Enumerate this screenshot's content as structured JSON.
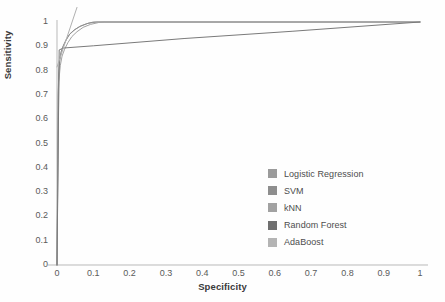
{
  "chart_data": {
    "type": "line",
    "title": "",
    "xlabel": "Specificity",
    "ylabel": "Sensitivity",
    "xlim": [
      0,
      1
    ],
    "ylim": [
      0,
      1
    ],
    "grid": false,
    "legend_position": "center-right",
    "xticks": [
      "0",
      "0.1",
      "0.2",
      "0.3",
      "0.4",
      "0.5",
      "0.6",
      "0.7",
      "0.8",
      "0.9",
      "1"
    ],
    "yticks": [
      "0",
      "0.1",
      "0.2",
      "0.3",
      "0.4",
      "0.5",
      "0.6",
      "0.7",
      "0.8",
      "0.9",
      "1"
    ],
    "series": [
      {
        "name": "Logistic Regression",
        "color": "#9b9b9b",
        "points": [
          [
            0,
            0
          ],
          [
            0.004,
            0.72
          ],
          [
            0.006,
            0.8
          ],
          [
            0.008,
            0.845
          ],
          [
            0.012,
            0.88
          ],
          [
            0.018,
            0.905
          ],
          [
            0.026,
            0.93
          ],
          [
            0.036,
            0.952
          ],
          [
            0.05,
            0.97
          ],
          [
            0.066,
            0.984
          ],
          [
            0.086,
            0.995
          ],
          [
            0.11,
            1.0
          ],
          [
            1,
            1
          ]
        ]
      },
      {
        "name": "SVM",
        "color": "#8e8e8e",
        "points": [
          [
            0,
            0
          ],
          [
            0.003,
            0.7
          ],
          [
            0.005,
            0.79
          ],
          [
            0.007,
            0.84
          ],
          [
            0.011,
            0.875
          ],
          [
            0.017,
            0.9
          ],
          [
            0.025,
            0.925
          ],
          [
            0.034,
            0.948
          ],
          [
            0.047,
            0.966
          ],
          [
            0.062,
            0.981
          ],
          [
            0.082,
            0.993
          ],
          [
            0.1,
            1.0
          ],
          [
            1,
            1
          ]
        ]
      },
      {
        "name": "kNN",
        "color": "#a2a2a2",
        "points": [
          [
            0,
            0
          ],
          [
            0.005,
            0.755
          ],
          [
            0.009,
            0.82
          ],
          [
            0.014,
            0.86
          ],
          [
            0.021,
            0.888
          ],
          [
            0.03,
            0.915
          ],
          [
            0.041,
            0.94
          ],
          [
            0.055,
            0.96
          ],
          [
            0.072,
            0.978
          ],
          [
            0.092,
            0.99
          ],
          [
            0.115,
            0.998
          ],
          [
            0.13,
            1.0
          ],
          [
            1,
            1
          ]
        ]
      },
      {
        "name": "Random Forest",
        "color": "#7a7a7a",
        "points": [
          [
            0,
            0
          ],
          [
            0.006,
            0.885
          ],
          [
            0.018,
            0.893
          ],
          [
            0.1,
            0.902
          ],
          [
            0.35,
            0.932
          ],
          [
            0.65,
            0.962
          ],
          [
            1,
            1
          ]
        ]
      },
      {
        "name": "AdaBoost",
        "color": "#b0b0b0",
        "points": [
          [
            0,
            0.815
          ],
          [
            0.055,
            1.06
          ]
        ]
      }
    ],
    "legend": [
      {
        "label": "Logistic Regression",
        "swatch": "#9b9b9b"
      },
      {
        "label": "SVM",
        "swatch": "#8e8e8e"
      },
      {
        "label": "kNN",
        "swatch": "#a2a2a2"
      },
      {
        "label": "Random Forest",
        "swatch": "#6f6f6f"
      },
      {
        "label": "AdaBoost",
        "swatch": "#b4b4b4"
      }
    ]
  }
}
